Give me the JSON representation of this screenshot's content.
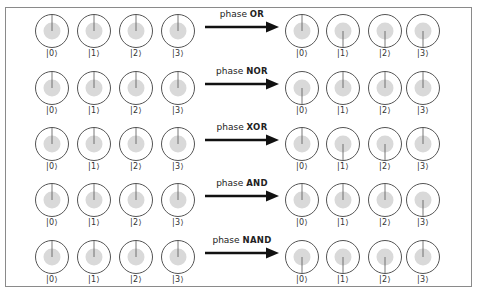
{
  "diagram": {
    "ket_labels": [
      "|0⟩",
      "|1⟩",
      "|2⟩",
      "|3⟩"
    ],
    "colors": {
      "circle_stroke": "#555555",
      "disc_fill": "#d9d9d9",
      "phase_line": "#555555",
      "arrow": "#111111",
      "frame": "#8a8a8a"
    },
    "rows": [
      {
        "prefix": "phase",
        "operation": "OR",
        "input_phases": [
          "up",
          "up",
          "up",
          "up"
        ],
        "output_phases": [
          "up",
          "down",
          "down",
          "down"
        ]
      },
      {
        "prefix": "phase",
        "operation": "NOR",
        "input_phases": [
          "up",
          "up",
          "up",
          "up"
        ],
        "output_phases": [
          "down",
          "up",
          "up",
          "up"
        ]
      },
      {
        "prefix": "phase",
        "operation": "XOR",
        "input_phases": [
          "up",
          "up",
          "up",
          "up"
        ],
        "output_phases": [
          "up",
          "down",
          "down",
          "up"
        ]
      },
      {
        "prefix": "phase",
        "operation": "AND",
        "input_phases": [
          "up",
          "up",
          "up",
          "up"
        ],
        "output_phases": [
          "up",
          "up",
          "up",
          "down"
        ]
      },
      {
        "prefix": "phase",
        "operation": "NAND",
        "input_phases": [
          "up",
          "up",
          "up",
          "up"
        ],
        "output_phases": [
          "down",
          "down",
          "down",
          "up"
        ]
      }
    ]
  }
}
